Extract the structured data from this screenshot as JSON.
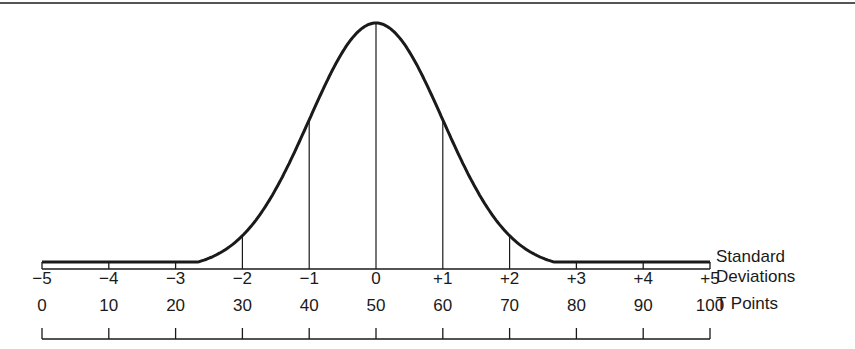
{
  "chart_data": {
    "type": "line",
    "curve": "normal (bell) curve, mean 0, sd 1",
    "x": [
      -5,
      -4,
      -3,
      -2,
      -1,
      0,
      1,
      2,
      3,
      4,
      5
    ],
    "relative_height": [
      0.0,
      0.0,
      0.011,
      0.135,
      0.607,
      1.0,
      0.607,
      0.135,
      0.011,
      0.0,
      0.0
    ],
    "vertical_lines_at": [
      -2,
      -1,
      0,
      1,
      2
    ],
    "axes": [
      {
        "name": "Standard Deviations",
        "ticks": [
          "−5",
          "−4",
          "−3",
          "−2",
          "−1",
          "0",
          "+1",
          "+2",
          "+3",
          "+4",
          "+5"
        ]
      },
      {
        "name": "T Points",
        "ticks": [
          "0",
          "10",
          "20",
          "30",
          "40",
          "50",
          "60",
          "70",
          "80",
          "90",
          "100"
        ]
      }
    ],
    "legend_label_lines": [
      "Standard",
      "Deviations",
      "T Points"
    ],
    "xlim": [
      -5,
      5
    ],
    "grid": false
  },
  "labels": {
    "sd_title_1": "Standard",
    "sd_title_2": "Deviations",
    "t_title": "T Points"
  },
  "geometry": {
    "x0": 42,
    "unit": 66.8,
    "baseline": 269,
    "peak": 246,
    "tail": 262
  },
  "colors": {
    "ink": "#1a1a1a",
    "background": "#ffffff"
  }
}
